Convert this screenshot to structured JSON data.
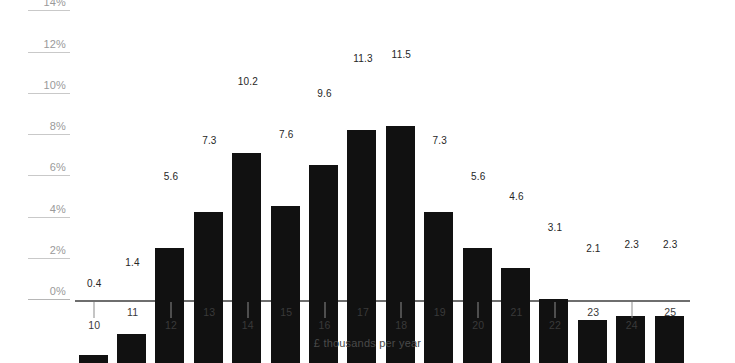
{
  "chart_data": {
    "type": "bar",
    "title": "",
    "subtitle": "",
    "xlabel": "£ thousands per year",
    "ylabel": "",
    "categories": [
      "10",
      "11",
      "12",
      "13",
      "14",
      "15",
      "16",
      "17",
      "18",
      "19",
      "20",
      "21",
      "22",
      "23",
      "24",
      "25"
    ],
    "values": [
      0.4,
      1.4,
      5.6,
      7.3,
      10.2,
      7.6,
      9.6,
      11.3,
      11.5,
      7.3,
      5.6,
      4.6,
      3.1,
      2.1,
      2.3,
      2.3
    ],
    "value_labels": [
      "0.4",
      "1.4",
      "5.6",
      "7.3",
      "10.2",
      "7.6",
      "9.6",
      "11.3",
      "11.5",
      "7.3",
      "5.6",
      "4.6",
      "3.1",
      "2.1",
      "2.3",
      "2.3"
    ],
    "ylim": [
      0,
      14
    ],
    "ytick_values": [
      0,
      2,
      4,
      6,
      8,
      10,
      12,
      14
    ],
    "ytick_labels": [
      "0%",
      "2%",
      "4%",
      "6%",
      "8%",
      "10%",
      "12%",
      "14%"
    ],
    "grid": "y-axis-left-stubs",
    "legend": "none",
    "bar_color": "#111111",
    "gridline_color": "#c9c9c9",
    "axis_color": "#6e6e6e",
    "ytick_label_color": "#9a9a9a",
    "value_label_color": "#262626",
    "xtick_label_color": "#3a3a3a",
    "background_color": "#ffffff"
  }
}
